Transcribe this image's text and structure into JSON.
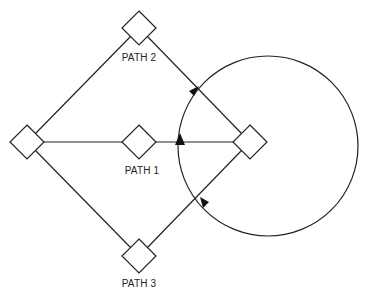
{
  "diagram": {
    "labels": {
      "path1": "PATH 1",
      "path2": "PATH 2",
      "path3": "PATH 3"
    },
    "nodes": [
      {
        "id": "left",
        "x": 27,
        "y": 142
      },
      {
        "id": "top",
        "x": 139,
        "y": 28
      },
      {
        "id": "middle",
        "x": 139,
        "y": 142
      },
      {
        "id": "bottom",
        "x": 139,
        "y": 256
      },
      {
        "id": "right",
        "x": 250,
        "y": 142
      }
    ],
    "circle": {
      "cx": 268,
      "cy": 146,
      "r": 90
    },
    "stroke_color": "#222222"
  }
}
